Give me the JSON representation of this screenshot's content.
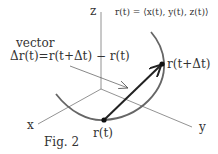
{
  "figure": {
    "caption": "Fig. 2",
    "formula": "r(t) = ⟨x(t), y(t), z(t)⟩",
    "vector_label_line1": "vector",
    "vector_label_line2": "Δr(t)=r(t+Δt) − r(t)",
    "axes": {
      "x": "x",
      "y": "y",
      "z": "z"
    },
    "points": {
      "start": "r(t)",
      "end": "r(t+Δt)"
    },
    "colors": {
      "curve": "#666666",
      "axis": "#777777",
      "vector": "#222222",
      "point": "#111111",
      "text": "#333333"
    }
  }
}
